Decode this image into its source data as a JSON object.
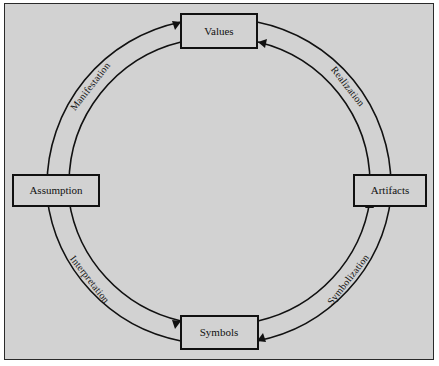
{
  "figure": {
    "background_color": "#d2d2d2",
    "frame_border_color": "#2a2a2a",
    "line_color": "#111111"
  },
  "nodes": [
    {
      "id": "values",
      "label": "Values",
      "position": "top"
    },
    {
      "id": "artifacts",
      "label": "Artifacts",
      "position": "right"
    },
    {
      "id": "symbols",
      "label": "Symbols",
      "position": "bottom"
    },
    {
      "id": "assumption",
      "label": "Assumption",
      "position": "left"
    }
  ],
  "arcs": [
    {
      "id": "realization",
      "label": "Realization",
      "from": "values",
      "to": "artifacts",
      "ring": "outer",
      "direction": "clockwise"
    },
    {
      "id": "symbolization",
      "label": "Symbolization",
      "from": "artifacts",
      "to": "symbols",
      "ring": "outer",
      "direction": "clockwise"
    },
    {
      "id": "interpretation",
      "label": "Interpretation",
      "from": "symbols",
      "to": "assumption",
      "ring": "outer",
      "direction": "clockwise"
    },
    {
      "id": "manifestation",
      "label": "Manifestation",
      "from": "assumption",
      "to": "values",
      "ring": "outer",
      "direction": "clockwise"
    },
    {
      "id": "inner-values-in",
      "label": "",
      "from": "artifacts",
      "to": "values",
      "ring": "inner",
      "direction": "counter-clockwise"
    },
    {
      "id": "inner-assumption-in",
      "label": "",
      "from": "values",
      "to": "assumption",
      "ring": "inner",
      "direction": "counter-clockwise"
    },
    {
      "id": "inner-symbols-in",
      "label": "",
      "from": "assumption",
      "to": "symbols",
      "ring": "inner",
      "direction": "counter-clockwise"
    },
    {
      "id": "inner-artifacts-in",
      "label": "",
      "from": "symbols",
      "to": "artifacts",
      "ring": "inner",
      "direction": "counter-clockwise"
    }
  ]
}
